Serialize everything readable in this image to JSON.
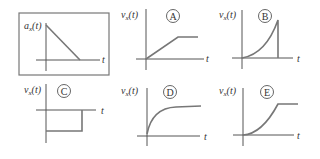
{
  "figure": {
    "given": {
      "label_main": "a",
      "label_sub": "x",
      "label_arg": "(t)",
      "time_axis_label": "t",
      "description": "Acceleration decreasing linearly from a positive value to zero"
    },
    "options": [
      {
        "letter": "A",
        "label_main": "v",
        "label_sub": "x",
        "label_arg": "(t)",
        "time_axis_label": "t",
        "shape": "linear ramp then constant"
      },
      {
        "letter": "B",
        "label_main": "v",
        "label_sub": "x",
        "label_arg": "(t)",
        "time_axis_label": "t",
        "shape": "concave-up rise then drop to zero"
      },
      {
        "letter": "C",
        "label_main": "v",
        "label_sub": "x",
        "label_arg": "(t)",
        "time_axis_label": "t",
        "shape": "negative constant for an interval"
      },
      {
        "letter": "D",
        "label_main": "v",
        "label_sub": "x",
        "label_arg": "(t)",
        "time_axis_label": "t",
        "shape": "concave-down rise leveling off"
      },
      {
        "letter": "E",
        "label_main": "v",
        "label_sub": "x",
        "label_arg": "(t)",
        "time_axis_label": "t",
        "shape": "concave-up rise then constant"
      }
    ],
    "colors": {
      "axis": "#555555",
      "curve": "#777777",
      "frame": "#777777",
      "background": "#ffffff"
    }
  }
}
